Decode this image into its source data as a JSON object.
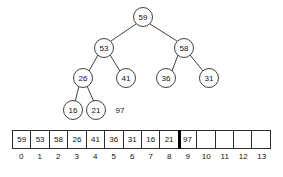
{
  "figure": {
    "colors": {
      "stroke": "#2b2b2b",
      "text": "#111111",
      "background": "#ffffff",
      "boundary_marker": "#000000"
    }
  },
  "tree": {
    "nodes": [
      {
        "id": "n0",
        "label": "59",
        "cx": 143,
        "cy": 17,
        "r": 9.5,
        "level": 0
      },
      {
        "id": "n1",
        "label": "53",
        "cx": 104,
        "cy": 48,
        "r": 9.5,
        "level": 1
      },
      {
        "id": "n2",
        "label": "58",
        "cx": 184,
        "cy": 48,
        "r": 9.5,
        "level": 1
      },
      {
        "id": "n3",
        "label": "26",
        "cx": 83,
        "cy": 78,
        "r": 9.5,
        "level": 2
      },
      {
        "id": "n4",
        "label": "41",
        "cx": 126,
        "cy": 78,
        "r": 9.5,
        "level": 2
      },
      {
        "id": "n5",
        "label": "36",
        "cx": 166,
        "cy": 78,
        "r": 9.5,
        "level": 2
      },
      {
        "id": "n6",
        "label": "31",
        "cx": 209,
        "cy": 78,
        "r": 9.5,
        "level": 2
      },
      {
        "id": "n7",
        "label": "16",
        "cx": 73,
        "cy": 110,
        "r": 9.5,
        "level": 3
      },
      {
        "id": "n8",
        "label": "21",
        "cx": 96,
        "cy": 110,
        "r": 9.5,
        "level": 3
      }
    ],
    "edges": [
      {
        "from": "n0",
        "to": "n1",
        "x1": 136,
        "y1": 24,
        "x2": 111,
        "y2": 41
      },
      {
        "from": "n0",
        "to": "n2",
        "x1": 150,
        "y1": 24,
        "x2": 177,
        "y2": 41
      },
      {
        "from": "n1",
        "to": "n3",
        "x1": 98,
        "y1": 55,
        "x2": 89,
        "y2": 71
      },
      {
        "from": "n1",
        "to": "n4",
        "x1": 110,
        "y1": 55,
        "x2": 120,
        "y2": 71
      },
      {
        "from": "n2",
        "to": "n5",
        "x1": 178,
        "y1": 55,
        "x2": 172,
        "y2": 71
      },
      {
        "from": "n2",
        "to": "n6",
        "x1": 190,
        "y1": 55,
        "x2": 203,
        "y2": 71
      },
      {
        "from": "n3",
        "to": "n7",
        "x1": 79,
        "y1": 86,
        "x2": 75,
        "y2": 102
      },
      {
        "from": "n3",
        "to": "n8",
        "x1": 87,
        "y1": 86,
        "x2": 94,
        "y2": 102
      }
    ],
    "detached_value": {
      "label": "97",
      "cx": 120,
      "cy": 110,
      "circled": false
    }
  },
  "array": {
    "cells": [
      {
        "index": "0",
        "value": "59",
        "boundary_before": false
      },
      {
        "index": "1",
        "value": "53",
        "boundary_before": false
      },
      {
        "index": "2",
        "value": "58",
        "boundary_before": false
      },
      {
        "index": "3",
        "value": "26",
        "boundary_before": false
      },
      {
        "index": "4",
        "value": "41",
        "boundary_before": false
      },
      {
        "index": "5",
        "value": "36",
        "boundary_before": false
      },
      {
        "index": "6",
        "value": "31",
        "boundary_before": false
      },
      {
        "index": "7",
        "value": "16",
        "boundary_before": false
      },
      {
        "index": "8",
        "value": "21",
        "boundary_before": false
      },
      {
        "index": "9",
        "value": "97",
        "boundary_before": true
      },
      {
        "index": "10",
        "value": "",
        "boundary_before": false
      },
      {
        "index": "11",
        "value": "",
        "boundary_before": false
      },
      {
        "index": "12",
        "value": "",
        "boundary_before": false
      },
      {
        "index": "13",
        "value": "",
        "boundary_before": false
      }
    ]
  }
}
